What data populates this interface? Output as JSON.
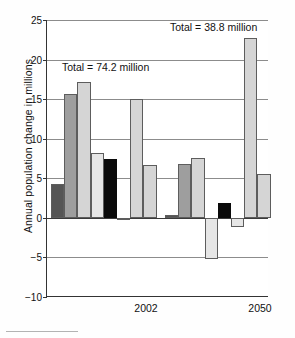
{
  "chart_data": {
    "type": "bar",
    "title": "",
    "xlabel": "",
    "ylabel": "Annual population change in millions",
    "ylim": [
      -10,
      25
    ],
    "yticks": [
      25,
      20,
      15,
      10,
      5,
      0,
      -5,
      -10
    ],
    "ytick_labels": [
      "25",
      "20",
      "15",
      "10",
      "5",
      "0",
      "−5",
      "−10"
    ],
    "grid": true,
    "legend": "none",
    "categories": [
      "2002",
      "2050"
    ],
    "annotations": [
      {
        "text": "Total = 74.2 million",
        "group": "2002",
        "value": 74.2
      },
      {
        "text": "Total = 38.8 million",
        "group": "2050",
        "value": 38.8
      }
    ],
    "groups": [
      {
        "label": "2002",
        "bars": [
          {
            "value": 4.3,
            "color": "#555555",
            "shade": "dark"
          },
          {
            "value": 15.6,
            "color": "#9e9e9e",
            "shade": "mid"
          },
          {
            "value": 17.2,
            "color": "#d5d5d5",
            "shade": "light"
          },
          {
            "value": 8.2,
            "color": "#e6e6e6",
            "shade": "pale"
          },
          {
            "value": 7.4,
            "color": "#0a0a0a",
            "shade": "black"
          },
          {
            "value": -0.3,
            "color": "#e6e6e6",
            "shade": "pale"
          },
          {
            "value": 15.0,
            "color": "#d5d5d5",
            "shade": "light"
          },
          {
            "value": 6.7,
            "color": "#d5d5d5",
            "shade": "light"
          }
        ]
      },
      {
        "label": "2050",
        "bars": [
          {
            "value": 0.3,
            "color": "#555555",
            "shade": "dark"
          },
          {
            "value": 6.8,
            "color": "#9e9e9e",
            "shade": "mid"
          },
          {
            "value": 7.6,
            "color": "#d5d5d5",
            "shade": "light"
          },
          {
            "value": -5.2,
            "color": "#e6e6e6",
            "shade": "pale"
          },
          {
            "value": 1.9,
            "color": "#0a0a0a",
            "shade": "black"
          },
          {
            "value": -1.1,
            "color": "#e6e6e6",
            "shade": "pale"
          },
          {
            "value": 22.7,
            "color": "#d5d5d5",
            "shade": "light"
          },
          {
            "value": 5.6,
            "color": "#d5d5d5",
            "shade": "light"
          }
        ]
      }
    ]
  },
  "layout": {
    "plot": {
      "left": 46,
      "top": 20,
      "width": 222,
      "height": 277
    },
    "bar_width": 13.2,
    "group_starts": [
      4,
      118
    ],
    "annotation_positions": [
      {
        "left": 16,
        "top": 41
      },
      {
        "left": 124,
        "top": 1
      }
    ],
    "xtick_centers": [
      100,
      214
    ]
  }
}
